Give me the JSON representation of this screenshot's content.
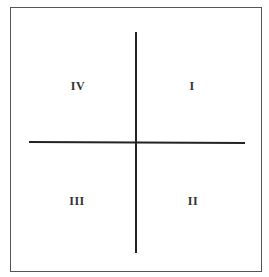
{
  "diagram": {
    "type": "quadrant",
    "quadrants": {
      "top_left": "IV",
      "top_right": "I",
      "bottom_left": "III",
      "bottom_right": "II"
    },
    "colors": {
      "background": "#ffffff",
      "frame": "#555555",
      "axes": "#222222",
      "labels": "#333333"
    }
  }
}
